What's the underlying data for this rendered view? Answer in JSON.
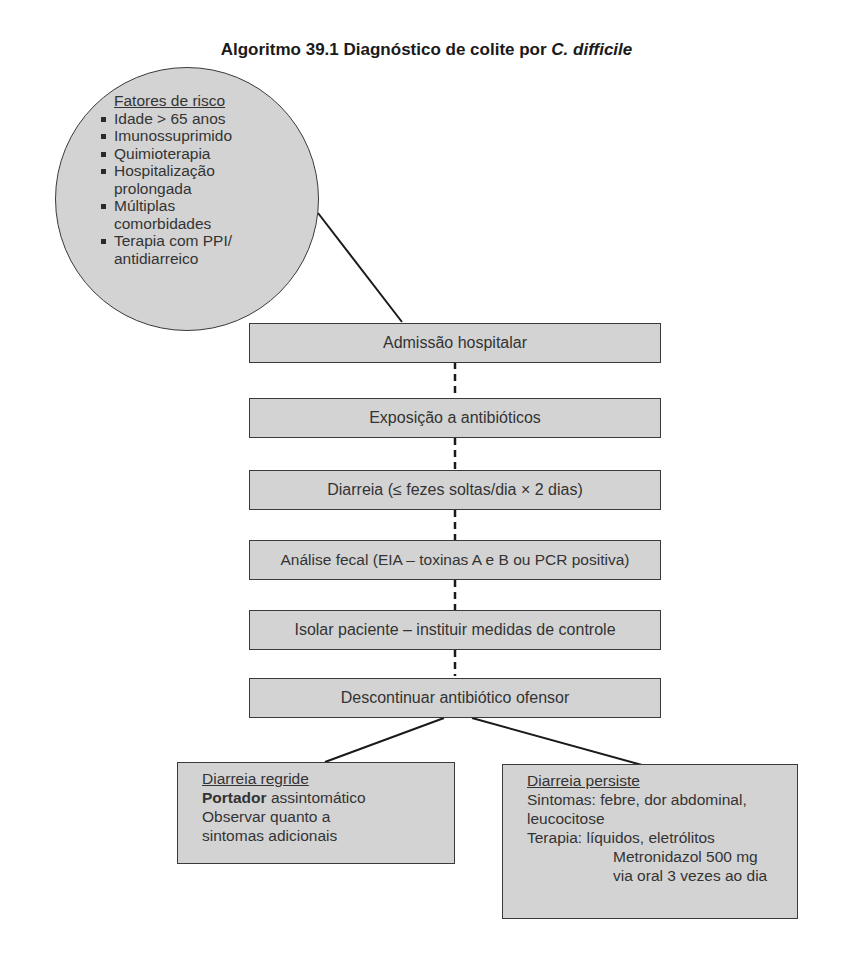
{
  "title": {
    "prefix": "Algoritmo 39.1 Diagnóstico de colite por ",
    "italic": "C. difficile"
  },
  "risk_factors": {
    "heading": "Fatores de risco",
    "items": [
      "Idade > 65 anos",
      "Imunossuprimido",
      "Quimioterapia",
      "Hospitalização prolongada",
      "Múltiplas comorbidades",
      "Terapia com PPI/ antidiarreico"
    ],
    "lines": [
      [
        "Idade > 65 anos"
      ],
      [
        "Imunossuprimido"
      ],
      [
        "Quimioterapia"
      ],
      [
        "Hospitalização",
        "prolongada"
      ],
      [
        "Múltiplas",
        "comorbidades"
      ],
      [
        "Terapia com PPI/",
        "antidiarreico"
      ]
    ]
  },
  "steps": [
    "Admissão hospitalar",
    "Exposição a antibióticos",
    "Diarreia (≤ fezes soltas/dia × 2 dias)",
    "Análise fecal (EIA – toxinas A e B ou PCR positiva)",
    "Isolar paciente – instituir medidas de controle",
    "Descontinuar antibiótico ofensor"
  ],
  "outcomes": {
    "regride": {
      "heading": "Diarreia regride",
      "bold": "Portador",
      "bold_rest": " assintomático",
      "line2": "Observar quanto a",
      "line3": "sintomas adicionais"
    },
    "persiste": {
      "heading": "Diarreia persiste",
      "line1": "Sintomas: febre, dor abdominal,",
      "line2": "leucocitose",
      "line3": "Terapia: líquidos, eletrólitos",
      "line4": "Metronidazol 500 mg",
      "line5": "via oral 3 vezes ao dia"
    }
  },
  "colors": {
    "fill": "#d3d3d3",
    "stroke": "#3a3a3a",
    "background": "#ffffff"
  }
}
